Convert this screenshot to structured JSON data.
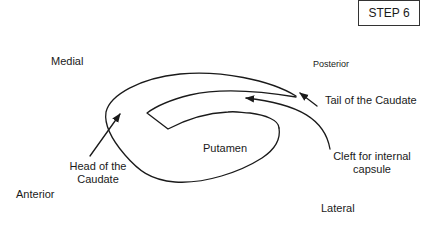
{
  "step_label": "STEP 6",
  "orientation": {
    "medial": "Medial",
    "posterior": "Posterior",
    "anterior": "Anterior",
    "lateral": "Lateral"
  },
  "structures": {
    "putamen": "Putamen",
    "tail_caudate": "Tail of the Caudate",
    "head_caudate_line1": "Head of the",
    "head_caudate_line2": "Caudate",
    "cleft_line1": "Cleft for internal",
    "cleft_line2": "capsule"
  },
  "colors": {
    "stroke": "#1a1a1a",
    "background": "#ffffff"
  }
}
